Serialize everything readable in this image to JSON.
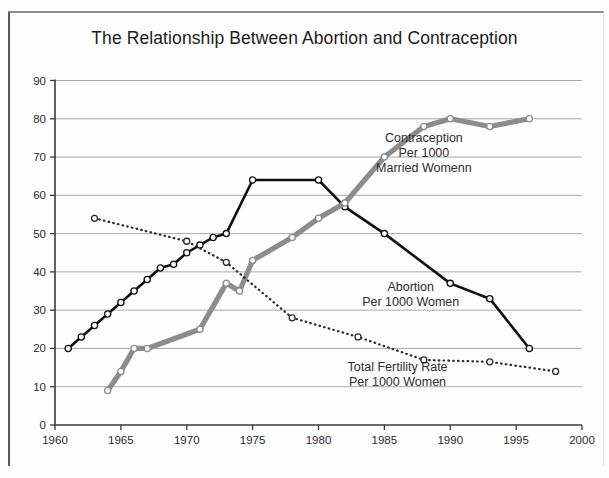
{
  "figure": {
    "title": "The Relationship Between Abortion and Contraception",
    "background_color": "#fefefe",
    "frame_color": "#5a5a5a"
  },
  "chart_data": {
    "type": "line",
    "title": "The Relationship Between Abortion and Contraception",
    "xlabel": "",
    "ylabel": "",
    "xlim": [
      1960,
      2000
    ],
    "ylim": [
      0,
      90
    ],
    "xticks": [
      1960,
      1965,
      1970,
      1975,
      1980,
      1985,
      1990,
      1995,
      2000
    ],
    "yticks": [
      0,
      10,
      20,
      30,
      40,
      50,
      60,
      70,
      80,
      90
    ],
    "grid": "horizontal",
    "legend_position": "inline-annotations",
    "series": [
      {
        "name": "Abortion Per 1000 Women",
        "color": "#101010",
        "style": "solid",
        "marker": "open-circle",
        "linewidth": 2.6,
        "x": [
          1961,
          1962,
          1963,
          1964,
          1965,
          1966,
          1967,
          1968,
          1969,
          1970,
          1971,
          1972,
          1973,
          1975,
          1980,
          1982,
          1985,
          1990,
          1993,
          1996
        ],
        "y": [
          20,
          23,
          26,
          29,
          32,
          35,
          38,
          41,
          42,
          45,
          47,
          49,
          50,
          64,
          64,
          57,
          50,
          37,
          33,
          20
        ]
      },
      {
        "name": "Contraception Per 1000 Married Womenn",
        "color": "#8c8c8c",
        "style": "solid",
        "marker": "open-circle",
        "linewidth": 5.2,
        "x": [
          1964,
          1965,
          1966,
          1967,
          1971,
          1973,
          1974,
          1975,
          1978,
          1980,
          1982,
          1985,
          1988,
          1990,
          1993,
          1996
        ],
        "y": [
          9,
          14,
          20,
          20,
          25,
          37,
          35,
          43,
          49,
          54,
          58,
          70,
          78,
          80,
          78,
          80
        ]
      },
      {
        "name": "Total Fertility Rate Per 1000 Women",
        "color": "#2a2a2a",
        "style": "dotted",
        "marker": "open-circle",
        "linewidth": 2.2,
        "x": [
          1963,
          1970,
          1973,
          1978,
          1983,
          1988,
          1993,
          1998
        ],
        "y": [
          54,
          48,
          42.5,
          28,
          23,
          17,
          16.5,
          14
        ]
      }
    ],
    "annotations": [
      {
        "name": "contraception-label",
        "lines": [
          "Contraception",
          "Per 1000",
          "Married Womenn"
        ],
        "x": 1988,
        "y": 74
      },
      {
        "name": "abortion-label",
        "lines": [
          "Abortion",
          "Per 1000 Women"
        ],
        "x": 1987,
        "y": 35
      },
      {
        "name": "fertility-label",
        "lines": [
          "Total Fertility Rate",
          "Per 1000 Women"
        ],
        "x": 1986,
        "y": 14
      }
    ]
  }
}
